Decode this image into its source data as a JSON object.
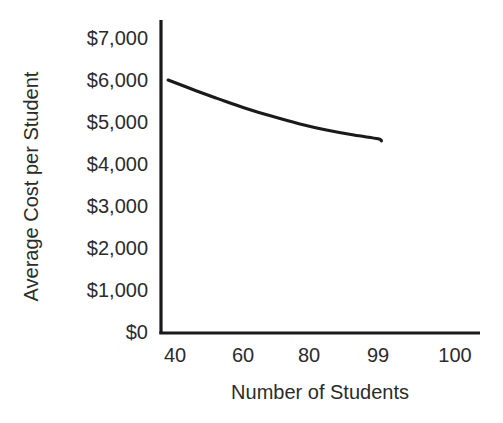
{
  "chart_data": {
    "type": "line",
    "title": "",
    "xlabel": "Number of Students",
    "ylabel": "Average Cost per Student",
    "x_tick_labels": [
      "40",
      "60",
      "80",
      "99",
      "100"
    ],
    "y_tick_labels": [
      "$7,000",
      "$6,000",
      "$5,000",
      "$4,000",
      "$3,000",
      "$2,000",
      "$1,000",
      "$0"
    ],
    "y_tick_values": [
      7000,
      6000,
      5000,
      4000,
      3000,
      2000,
      1000,
      0
    ],
    "ylim": [
      0,
      7000
    ],
    "grid": false,
    "legend": false,
    "series": [
      {
        "name": "Average Cost per Student",
        "x": [
          38,
          45,
          52,
          60,
          68,
          76,
          84,
          92,
          99,
          100
        ],
        "values": [
          6000,
          5780,
          5570,
          5340,
          5140,
          4960,
          4810,
          4690,
          4600,
          4550
        ]
      }
    ],
    "line_color": "#1a1a1a",
    "axis_color": "#1a1a1a"
  },
  "axes": {
    "x_ticks": [
      {
        "label": "40",
        "px": 175
      },
      {
        "label": "60",
        "px": 243
      },
      {
        "label": "80",
        "px": 309
      },
      {
        "label": "99",
        "px": 378
      },
      {
        "label": "100",
        "px": 455
      }
    ],
    "y_ticks": [
      {
        "label": "$7,000",
        "px": 38
      },
      {
        "label": "$6,000",
        "px": 80
      },
      {
        "label": "$5,000",
        "px": 122
      },
      {
        "label": "$4,000",
        "px": 164
      },
      {
        "label": "$3,000",
        "px": 206
      },
      {
        "label": "$2,000",
        "px": 248
      },
      {
        "label": "$1,000",
        "px": 290
      },
      {
        "label": "$0",
        "px": 332
      }
    ]
  },
  "titles": {
    "y_axis": "Average Cost per Student",
    "x_axis": "Number of Students"
  }
}
